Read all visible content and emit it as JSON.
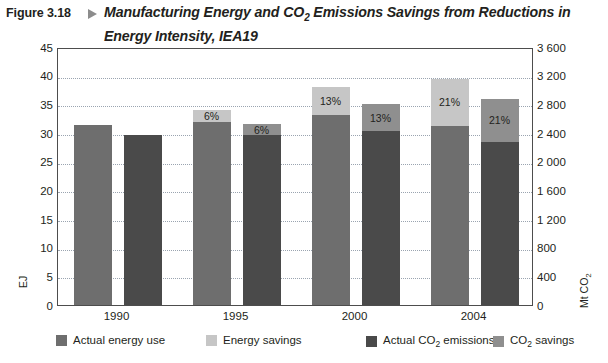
{
  "figure": {
    "label": "Figure 3.18",
    "arrow_icon": "triangle-right-icon",
    "title_line1_pre": "Manufacturing Energy and CO",
    "title_line1_sub": "2",
    "title_line1_post": " Emissions Savings from Reductions",
    "title_line2": "in Energy Intensity, IEA19"
  },
  "chart_data": {
    "type": "bar",
    "title": "Manufacturing Energy and CO2 Emissions Savings from Reductions in Energy Intensity, IEA19",
    "categories": [
      "1990",
      "1995",
      "2000",
      "2004"
    ],
    "xlabel": "",
    "ylabel": "EJ",
    "ylabel_right": "Mt CO2",
    "ylim": [
      0,
      45
    ],
    "ylim_right": [
      0,
      3600
    ],
    "yticks": [
      "0",
      "5",
      "10",
      "15",
      "20",
      "25",
      "30",
      "35",
      "40",
      "45"
    ],
    "yticks_right": [
      "0",
      "400",
      "800",
      "1 200",
      "1 600",
      "2 000",
      "2 400",
      "2 800",
      "3 200",
      "3 600"
    ],
    "grid": true,
    "legend_position": "bottom",
    "series": [
      {
        "name": "Actual energy use",
        "axis": "left",
        "color": "#6e6e6e",
        "values": [
          31.4,
          31.9,
          33.1,
          31.2
        ]
      },
      {
        "name": "Energy savings",
        "axis": "left",
        "color": "#c6c6c6",
        "values": [
          0,
          2.1,
          4.9,
          8.3
        ],
        "labels": [
          "",
          "6%",
          "13%",
          "21%"
        ]
      },
      {
        "name": "Actual CO2 emissions",
        "axis": "right",
        "color": "#4a4a4a",
        "values": [
          29.6,
          29.6,
          30.4,
          28.4
        ]
      },
      {
        "name": "CO2 savings",
        "axis": "right",
        "color": "#8f8f8f",
        "values": [
          0,
          1.9,
          4.6,
          7.6
        ],
        "labels": [
          "",
          "6%",
          "13%",
          "21%"
        ]
      }
    ]
  },
  "legend": [
    {
      "label_pre": "Actual energy use",
      "label_sub": "",
      "label_post": "",
      "color": "#6e6e6e",
      "name": "legend-actual-energy-use"
    },
    {
      "label_pre": "Energy savings",
      "label_sub": "",
      "label_post": "",
      "color": "#c6c6c6",
      "name": "legend-energy-savings"
    },
    {
      "label_pre": "Actual CO",
      "label_sub": "2",
      "label_post": " emissions",
      "color": "#4a4a4a",
      "name": "legend-actual-co2-emissions"
    },
    {
      "label_pre": "CO",
      "label_sub": "2",
      "label_post": " savings",
      "color": "#8f8f8f",
      "name": "legend-co2-savings"
    }
  ],
  "colors": {
    "frame": "#4d4d4d",
    "grid": "#9aa4b0",
    "text": "#231f20"
  }
}
